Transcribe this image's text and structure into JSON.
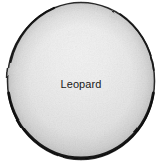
{
  "diagram": {
    "type": "venn-single-set",
    "style": "hand-drawn pencil sketch",
    "canvas": {
      "width": 162,
      "height": 168,
      "background": "#ffffff"
    },
    "shape": {
      "name": "circle",
      "center_x": 81,
      "center_y": 81,
      "radius_x": 74,
      "radius_y": 79,
      "outline_color": "#111111",
      "outline_width_top": 1.4,
      "outline_width_bottom": 3,
      "fill_rim_color": "#9a9a9a",
      "fill_mid_color": "#d4d4d4",
      "fill_highlight_color": "#fbfbfb",
      "highlight_center_x": 80,
      "highlight_center_y": 55,
      "texture": "graphite-grain"
    },
    "label": {
      "text": "Leopard",
      "x": 83,
      "y": 85,
      "color": "#1a1a1a",
      "font_size_px": 11
    }
  }
}
